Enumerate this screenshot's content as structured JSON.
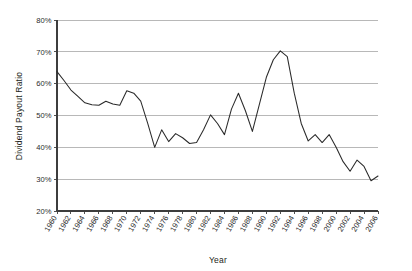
{
  "chart_data": {
    "type": "line",
    "title": "",
    "xlabel": "Year",
    "ylabel": "Dividend Payout Ratio",
    "xlim": [
      1960,
      2006
    ],
    "ylim": [
      20,
      80
    ],
    "ytick_labels": [
      "80%",
      "70%",
      "60%",
      "50%",
      "40%",
      "30%",
      "20%"
    ],
    "ytick_values": [
      80,
      70,
      60,
      50,
      40,
      30,
      20
    ],
    "xtick_labels": [
      "1960",
      "1962",
      "1964",
      "1966",
      "1968",
      "1970",
      "1972",
      "1974",
      "1976",
      "1978",
      "1980",
      "1982",
      "1984",
      "1986",
      "1988",
      "1990",
      "1992",
      "1994",
      "1996",
      "1998",
      "2000",
      "2002",
      "2004",
      "2006"
    ],
    "xtick_values": [
      1960,
      1962,
      1964,
      1966,
      1968,
      1970,
      1972,
      1974,
      1976,
      1978,
      1980,
      1982,
      1984,
      1986,
      1988,
      1990,
      1992,
      1994,
      1996,
      1998,
      2000,
      2002,
      2004,
      2006
    ],
    "grid": "horizontal",
    "legend": "none",
    "series": [
      {
        "name": "Dividend Payout Ratio",
        "color": "#2a2a2a",
        "x": [
          1960,
          1961,
          1962,
          1963,
          1964,
          1965,
          1966,
          1967,
          1968,
          1969,
          1970,
          1971,
          1972,
          1973,
          1974,
          1975,
          1976,
          1977,
          1978,
          1979,
          1980,
          1981,
          1982,
          1983,
          1984,
          1985,
          1986,
          1987,
          1988,
          1989,
          1990,
          1991,
          1992,
          1993,
          1994,
          1995,
          1996,
          1997,
          1998,
          1999,
          2000,
          2001,
          2002,
          2003,
          2004,
          2005,
          2006
        ],
        "values": [
          63.8,
          61.0,
          58.0,
          56.0,
          54.0,
          53.4,
          53.2,
          54.5,
          53.6,
          53.2,
          57.8,
          57.0,
          54.5,
          47.5,
          40.0,
          45.5,
          41.8,
          44.3,
          43.0,
          41.2,
          41.5,
          45.5,
          50.2,
          47.5,
          44.0,
          52.0,
          57.0,
          51.5,
          45.0,
          53.5,
          62.0,
          67.5,
          70.3,
          68.5,
          57.0,
          47.5,
          42.0,
          44.0,
          41.5,
          44.0,
          40.0,
          35.5,
          32.5,
          36.0,
          34.0,
          29.5,
          31.0
        ]
      }
    ]
  }
}
